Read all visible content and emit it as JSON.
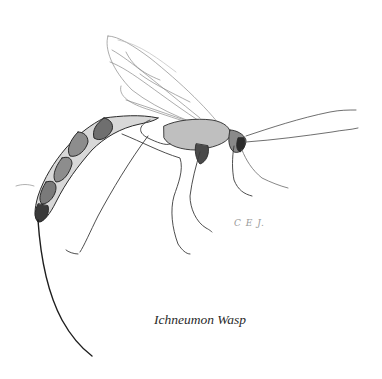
{
  "figure": {
    "signature": "C E J.",
    "caption": "Ichneumon Wasp"
  }
}
